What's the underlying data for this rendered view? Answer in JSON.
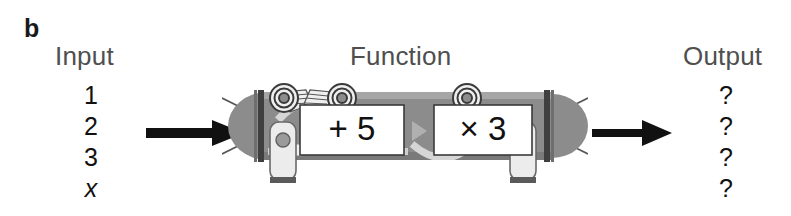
{
  "figure": {
    "panel_letter": "b",
    "background_color": "#ffffff"
  },
  "columns": {
    "input": {
      "heading": "Input",
      "values": [
        "1",
        "2",
        "3",
        "x"
      ],
      "variable_index": 3
    },
    "function": {
      "heading": "Function",
      "operations": [
        {
          "label": "+ 5",
          "operator": "+",
          "operand": "5"
        },
        {
          "label": "× 3",
          "operator": "×",
          "operand": "3"
        }
      ],
      "flow_separator": "triangle-right"
    },
    "output": {
      "heading": "Output",
      "values": [
        "?",
        "?",
        "?",
        "?"
      ]
    }
  },
  "arrows": {
    "input_arrow": "arrow-right",
    "output_arrow": "arrow-right"
  },
  "machine": {
    "name": "function-machine",
    "body_color": "#8c8c8c",
    "body_dark_color": "#3f3f3f",
    "panel_color": "#ffffff",
    "highlight_color": "#d8d8d8",
    "dial_count": 3,
    "lever_count": 2,
    "operation_text_color": "#111111"
  },
  "colors": {
    "heading_gray": "#4f4f4f",
    "text_black": "#111111",
    "machine_gray": "#8c8c8c",
    "machine_dark": "#3f3f3f"
  }
}
